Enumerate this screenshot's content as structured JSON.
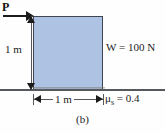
{
  "figure": {
    "caption": "(b)",
    "background_color": "#fefefe",
    "block": {
      "fill_color": "#aec2e3",
      "border_color": "#3f4651",
      "width_label": "1 m",
      "height_label": "1 m"
    },
    "ground": {
      "line_color": "#55585c"
    },
    "force": {
      "label": "P",
      "direction": "right",
      "applied_at": "top-left corner"
    },
    "weight": {
      "label": "W = 100 N",
      "symbol": "W",
      "value": "100",
      "unit": "N"
    },
    "friction": {
      "symbol": "μ",
      "subscript": "s",
      "equals": " = 0.4",
      "value": "0.4",
      "full_label": "μs = 0.4"
    },
    "dimensions": {
      "horizontal": "1 m",
      "vertical": "1 m"
    }
  }
}
